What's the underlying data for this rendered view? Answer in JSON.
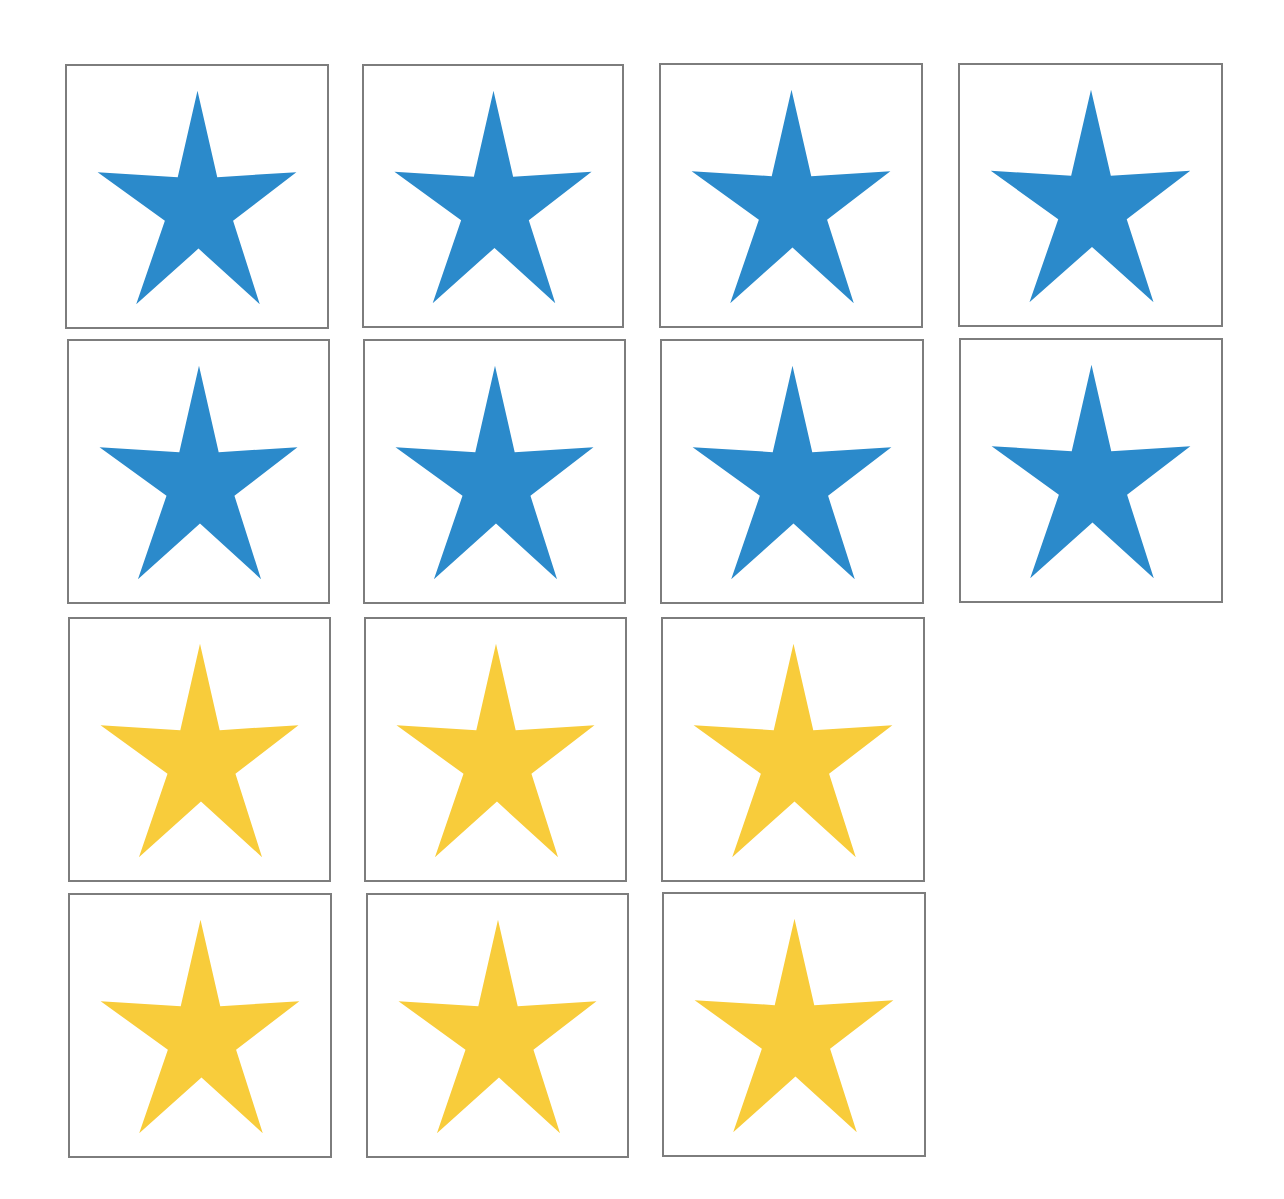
{
  "colors": {
    "blue": "#2b8acb",
    "yellow": "#f8cc3b",
    "border": "#7d7d7d",
    "background": "#ffffff"
  },
  "grid": {
    "total_stars": 14,
    "blue_count": 8,
    "yellow_count": 6,
    "rows": [
      {
        "row": 1,
        "stars": [
          "blue",
          "blue",
          "blue",
          "blue"
        ]
      },
      {
        "row": 2,
        "stars": [
          "blue",
          "blue",
          "blue",
          "blue"
        ]
      },
      {
        "row": 3,
        "stars": [
          "yellow",
          "yellow",
          "yellow"
        ]
      },
      {
        "row": 4,
        "stars": [
          "yellow",
          "yellow",
          "yellow"
        ]
      }
    ]
  },
  "cards": [
    {
      "icon": "star-icon",
      "color": "blue",
      "x": 65,
      "y": 64,
      "w": 264,
      "h": 265
    },
    {
      "icon": "star-icon",
      "color": "blue",
      "x": 362,
      "y": 64,
      "w": 262,
      "h": 264
    },
    {
      "icon": "star-icon",
      "color": "blue",
      "x": 659,
      "y": 63,
      "w": 264,
      "h": 265
    },
    {
      "icon": "star-icon",
      "color": "blue",
      "x": 958,
      "y": 63,
      "w": 265,
      "h": 264
    },
    {
      "icon": "star-icon",
      "color": "blue",
      "x": 67,
      "y": 339,
      "w": 263,
      "h": 265
    },
    {
      "icon": "star-icon",
      "color": "blue",
      "x": 363,
      "y": 339,
      "w": 263,
      "h": 265
    },
    {
      "icon": "star-icon",
      "color": "blue",
      "x": 660,
      "y": 339,
      "w": 264,
      "h": 265
    },
    {
      "icon": "star-icon",
      "color": "blue",
      "x": 959,
      "y": 338,
      "w": 264,
      "h": 265
    },
    {
      "icon": "star-icon",
      "color": "yellow",
      "x": 68,
      "y": 617,
      "w": 263,
      "h": 265
    },
    {
      "icon": "star-icon",
      "color": "yellow",
      "x": 364,
      "y": 617,
      "w": 263,
      "h": 265
    },
    {
      "icon": "star-icon",
      "color": "yellow",
      "x": 661,
      "y": 617,
      "w": 264,
      "h": 265
    },
    {
      "icon": "star-icon",
      "color": "yellow",
      "x": 68,
      "y": 893,
      "w": 264,
      "h": 265
    },
    {
      "icon": "star-icon",
      "color": "yellow",
      "x": 366,
      "y": 893,
      "w": 263,
      "h": 265
    },
    {
      "icon": "star-icon",
      "color": "yellow",
      "x": 662,
      "y": 892,
      "w": 264,
      "h": 265
    }
  ]
}
